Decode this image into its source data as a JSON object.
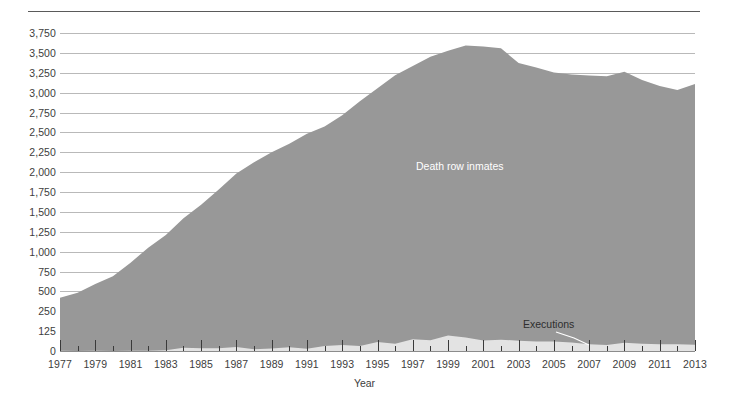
{
  "chart_data": {
    "type": "area",
    "title": "",
    "xlabel": "Year",
    "ylabel": "",
    "grid": true,
    "legend_position": "inline-annotations",
    "xlim": [
      1977,
      2013
    ],
    "ylim": [
      0,
      3750
    ],
    "x_tick_labels": [
      "1977",
      "1979",
      "1981",
      "1983",
      "1985",
      "1987",
      "1989",
      "1991",
      "1993",
      "1995",
      "1997",
      "1999",
      "2001",
      "2003",
      "2005",
      "2007",
      "2009",
      "2011",
      "2013"
    ],
    "y_tick_labels": [
      "0",
      "125",
      "250",
      "500",
      "750",
      "1,000",
      "1,250",
      "1,500",
      "1,750",
      "2,000",
      "2,250",
      "2,500",
      "2,750",
      "3,000",
      "3,250",
      "3,500",
      "3,750"
    ],
    "y_tick_values": [
      0,
      125,
      250,
      500,
      750,
      1000,
      1250,
      1500,
      1750,
      2000,
      2250,
      2500,
      2750,
      3000,
      3250,
      3500,
      3750
    ],
    "categories": [
      1977,
      1978,
      1979,
      1980,
      1981,
      1982,
      1983,
      1984,
      1985,
      1986,
      1987,
      1988,
      1989,
      1990,
      1991,
      1992,
      1993,
      1994,
      1995,
      1996,
      1997,
      1998,
      1999,
      2000,
      2001,
      2002,
      2003,
      2004,
      2005,
      2006,
      2007,
      2008,
      2009,
      2010,
      2011,
      2012,
      2013
    ],
    "series": [
      {
        "name": "Death row inmates",
        "color": "#989898",
        "label": "Death row inmates",
        "values": [
          420,
          482,
          593,
          691,
          860,
          1050,
          1209,
          1420,
          1591,
          1781,
          1984,
          2124,
          2250,
          2356,
          2482,
          2575,
          2716,
          2890,
          3054,
          3219,
          3335,
          3452,
          3527,
          3593,
          3581,
          3557,
          3374,
          3315,
          3254,
          3228,
          3215,
          3207,
          3263,
          3158,
          3082,
          3033,
          3108
        ]
      },
      {
        "name": "Executions",
        "color": "#e3e3e3",
        "label": "Executions",
        "values": [
          1,
          0,
          2,
          0,
          1,
          2,
          5,
          21,
          18,
          18,
          25,
          11,
          16,
          23,
          14,
          31,
          38,
          31,
          56,
          45,
          74,
          68,
          98,
          85,
          66,
          71,
          65,
          59,
          60,
          53,
          42,
          37,
          52,
          46,
          43,
          43,
          39
        ]
      }
    ]
  },
  "annotations": {
    "inmates_label": "Death row inmates",
    "executions_label": "Executions"
  },
  "colors": {
    "inmates_fill": "#989898",
    "executions_fill": "#e3e3e3",
    "gridline": "#b9b9b9",
    "axis": "#8c8c8c",
    "text": "#3d3d3d"
  }
}
